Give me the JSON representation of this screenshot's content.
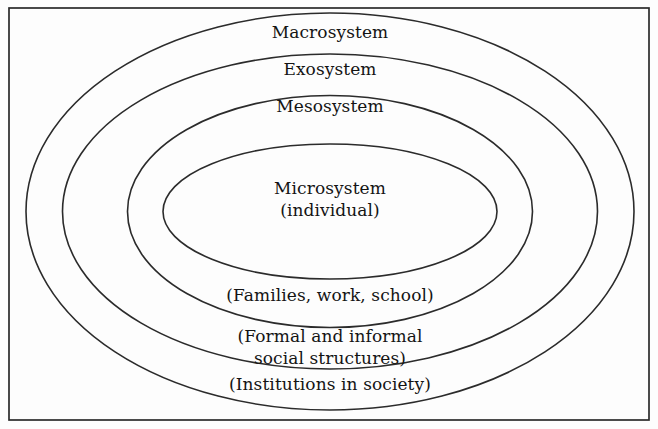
{
  "figure": {
    "kind": "nested-ellipse-diagram",
    "background_color": "#fdfdfd",
    "stroke_color": "#2b2b2b",
    "text_color": "#141414",
    "frame": {
      "name": "outer-border-frame",
      "x": 9,
      "y": 8,
      "width": 640,
      "height": 412
    },
    "center": {
      "cx": 330,
      "cy": 211.5
    },
    "rings": [
      {
        "id": "macrosystem",
        "label": "Macrosystem",
        "sublabel": "(Institutions in society)",
        "rx": 304,
        "ry": 198.5,
        "label_x": 330,
        "label_y": 33,
        "sublabel_x": 330,
        "sublabel_y": 385
      },
      {
        "id": "exosystem",
        "label": "Exosystem",
        "sublabel": "(Formal and informal\nsocial structures)",
        "rx": 267.5,
        "ry": 157.5,
        "label_x": 330,
        "label_y": 70,
        "sublabel_x": 330,
        "sublabel_y": 347
      },
      {
        "id": "mesosystem",
        "label": "Mesosystem",
        "sublabel": "(Families, work, school)",
        "rx": 202.5,
        "ry": 116,
        "label_x": 330,
        "label_y": 107,
        "sublabel_x": 330,
        "sublabel_y": 296
      },
      {
        "id": "microsystem",
        "label": "Microsystem\n(individual)",
        "sublabel": "",
        "rx": 167,
        "ry": 67.5,
        "label_x": 330,
        "label_y": 199,
        "sublabel_x": 0,
        "sublabel_y": 0
      }
    ]
  }
}
